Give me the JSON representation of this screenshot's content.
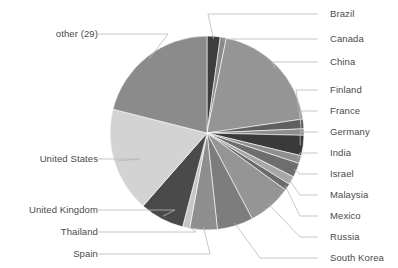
{
  "chart_data": {
    "type": "pie",
    "title": "",
    "xlabel": "",
    "ylabel": "",
    "legend_position": "callout-labels",
    "grid": false,
    "total": 100,
    "categories": [
      "Brazil",
      "Canada",
      "China",
      "Finland",
      "France",
      "Germany",
      "India",
      "Israel",
      "Malaysia",
      "Mexico",
      "Russia",
      "South Korea",
      "Spain",
      "Thailand",
      "United Kingdom",
      "United States",
      "other (29)"
    ],
    "values": [
      2.2,
      1.0,
      19.5,
      1.6,
      1.1,
      3.4,
      1.3,
      2.4,
      1.4,
      1.1,
      7.3,
      6.0,
      4.6,
      1.2,
      7.4,
      17.5,
      21.0
    ],
    "colors": [
      "#3d3d3d",
      "#8a8a8a",
      "#959595",
      "#5f5f5f",
      "#8e8e8e",
      "#3a3a3a",
      "#8f8f8f",
      "#6e6e6e",
      "#a7a7a7",
      "#6a6a6a",
      "#959595",
      "#7d7d7d",
      "#8e8e8e",
      "#c6c6c6",
      "#4a4a4a",
      "#d3d3d3",
      "#8b8b8b"
    ],
    "slices": [
      {
        "label": "Brazil",
        "value": 2.2,
        "color": "#3d3d3d",
        "start_deg": 0.0,
        "end_deg": 7.9
      },
      {
        "label": "Canada",
        "value": 1.0,
        "color": "#8a8a8a",
        "start_deg": 7.9,
        "end_deg": 11.5
      },
      {
        "label": "China",
        "value": 19.5,
        "color": "#959595",
        "start_deg": 11.5,
        "end_deg": 81.7
      },
      {
        "label": "Finland",
        "value": 1.6,
        "color": "#5f5f5f",
        "start_deg": 81.7,
        "end_deg": 87.5
      },
      {
        "label": "France",
        "value": 1.1,
        "color": "#8e8e8e",
        "start_deg": 87.5,
        "end_deg": 91.4
      },
      {
        "label": "Germany",
        "value": 3.4,
        "color": "#3a3a3a",
        "start_deg": 91.4,
        "end_deg": 103.6
      },
      {
        "label": "India",
        "value": 1.3,
        "color": "#8f8f8f",
        "start_deg": 103.6,
        "end_deg": 108.3
      },
      {
        "label": "Israel",
        "value": 2.4,
        "color": "#6e6e6e",
        "start_deg": 108.3,
        "end_deg": 116.9
      },
      {
        "label": "Malaysia",
        "value": 1.4,
        "color": "#a7a7a7",
        "start_deg": 116.9,
        "end_deg": 121.9
      },
      {
        "label": "Mexico",
        "value": 1.1,
        "color": "#6a6a6a",
        "start_deg": 121.9,
        "end_deg": 125.9
      },
      {
        "label": "Russia",
        "value": 7.3,
        "color": "#959595",
        "start_deg": 125.9,
        "end_deg": 152.2
      },
      {
        "label": "South Korea",
        "value": 6.0,
        "color": "#7d7d7d",
        "start_deg": 152.2,
        "end_deg": 173.8
      },
      {
        "label": "Spain",
        "value": 4.6,
        "color": "#8e8e8e",
        "start_deg": 173.8,
        "end_deg": 190.3
      },
      {
        "label": "Thailand",
        "value": 1.2,
        "color": "#c6c6c6",
        "start_deg": 190.3,
        "end_deg": 194.6
      },
      {
        "label": "United Kingdom",
        "value": 7.4,
        "color": "#4a4a4a",
        "start_deg": 194.6,
        "end_deg": 221.2
      },
      {
        "label": "United States",
        "value": 17.5,
        "color": "#d3d3d3",
        "start_deg": 221.2,
        "end_deg": 284.2
      },
      {
        "label": "other (29)",
        "value": 21.0,
        "color": "#8b8b8b",
        "start_deg": 284.2,
        "end_deg": 360.0
      }
    ]
  },
  "labels": {
    "brazil": "Brazil",
    "canada": "Canada",
    "china": "China",
    "finland": "Finland",
    "france": "France",
    "germany": "Germany",
    "india": "India",
    "israel": "Israel",
    "malaysia": "Malaysia",
    "mexico": "Mexico",
    "russia": "Russia",
    "south_korea": "South Korea",
    "spain": "Spain",
    "thailand": "Thailand",
    "united_kingdom": "United Kingdom",
    "united_states": "United States",
    "other": "other (29)"
  },
  "style": {
    "background": "#ffffff",
    "text_color": "#4a4a4a",
    "leader_color": "#b9b9b9"
  }
}
